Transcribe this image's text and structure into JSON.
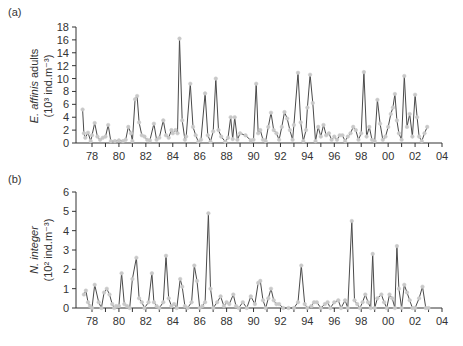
{
  "chart_data": [
    {
      "type": "line",
      "panel_label": "(a)",
      "title": "",
      "ylabel_species": "E. affinis",
      "ylabel_rest": " adults",
      "ylabel_unit": "(10³ ind.m⁻³)",
      "xlabel": "",
      "xlim": [
        1977,
        2004
      ],
      "ylim": [
        0,
        18
      ],
      "yticks": [
        0,
        2,
        4,
        6,
        8,
        10,
        12,
        14,
        16,
        18
      ],
      "xtick_labels": [
        "78",
        "80",
        "82",
        "84",
        "86",
        "88",
        "90",
        "92",
        "94",
        "96",
        "98",
        "00",
        "02",
        "04"
      ],
      "series": [
        {
          "name": "E. affinis adults",
          "x": [
            1977.3,
            1977.4,
            1977.5,
            1977.7,
            1977.9,
            1978.0,
            1978.2,
            1978.4,
            1978.6,
            1978.8,
            1979.0,
            1979.2,
            1979.4,
            1979.7,
            1980.0,
            1980.3,
            1980.5,
            1980.7,
            1980.9,
            1981.0,
            1981.2,
            1981.35,
            1981.5,
            1981.7,
            1981.9,
            1982.1,
            1982.3,
            1982.6,
            1982.8,
            1983.0,
            1983.3,
            1983.5,
            1983.7,
            1983.9,
            1984.0,
            1984.2,
            1984.35,
            1984.5,
            1984.7,
            1984.9,
            1985.0,
            1985.3,
            1985.5,
            1985.7,
            1985.9,
            1986.1,
            1986.4,
            1986.6,
            1986.8,
            1987.0,
            1987.2,
            1987.4,
            1987.6,
            1987.9,
            1988.1,
            1988.3,
            1988.45,
            1988.6,
            1988.8,
            1989.0,
            1989.4,
            1989.8,
            1990.0,
            1990.2,
            1990.35,
            1990.5,
            1990.7,
            1990.9,
            1991.1,
            1991.3,
            1991.5,
            1991.7,
            1991.9,
            1992.1,
            1992.3,
            1992.5,
            1992.7,
            1992.9,
            1993.0,
            1993.3,
            1993.5,
            1993.7,
            1993.9,
            1994.0,
            1994.2,
            1994.4,
            1994.6,
            1994.8,
            1995.0,
            1995.2,
            1995.4,
            1995.6,
            1995.8,
            1996.0,
            1996.2,
            1996.4,
            1996.6,
            1996.8,
            1997.0,
            1997.2,
            1997.4,
            1997.6,
            1997.8,
            1998.0,
            1998.2,
            1998.4,
            1998.6,
            1998.8,
            1999.0,
            1999.2,
            1999.4,
            1999.6,
            1999.8,
            2000.0,
            2000.2,
            2000.35,
            2000.5,
            2000.65,
            2000.8,
            2001.0,
            2001.2,
            2001.4,
            2001.6,
            2001.8,
            2002.0,
            2002.15,
            2002.3,
            2002.5,
            2002.7,
            2002.9
          ],
          "values": [
            5.2,
            1.5,
            0.8,
            1.6,
            0.3,
            1.2,
            3.1,
            1.0,
            0.5,
            0.8,
            1.0,
            2.8,
            0.3,
            0.3,
            0.4,
            0.3,
            0.5,
            2.5,
            1.5,
            0.3,
            6.8,
            7.3,
            3.2,
            1.2,
            1.0,
            0.5,
            0.4,
            3.0,
            0.5,
            0.8,
            3.5,
            1.2,
            0.8,
            2.0,
            1.5,
            2.0,
            1.5,
            16.2,
            3.5,
            0.5,
            1.0,
            9.2,
            2.5,
            1.2,
            0.2,
            0.5,
            7.7,
            1.2,
            0.2,
            1.8,
            10.0,
            2.0,
            1.0,
            0.2,
            0.8,
            4.0,
            0.6,
            4.0,
            0.5,
            1.5,
            1.2,
            0.4,
            0.5,
            9.2,
            1.5,
            2.0,
            0.5,
            0.3,
            2.5,
            4.7,
            2.0,
            1.5,
            0.5,
            2.5,
            4.8,
            3.8,
            2.0,
            0.5,
            2.8,
            10.9,
            3.2,
            0.3,
            2.0,
            5.5,
            10.6,
            6.2,
            0.3,
            2.5,
            1.0,
            2.8,
            1.2,
            1.5,
            0.5,
            1.0,
            0.5,
            1.2,
            1.2,
            0.3,
            1.0,
            1.5,
            2.5,
            2.0,
            0.5,
            1.5,
            11.0,
            1.0,
            2.5,
            0.5,
            0.3,
            6.7,
            3.0,
            0.5,
            1.0,
            2.5,
            4.5,
            5.5,
            7.6,
            3.5,
            1.5,
            0.5,
            10.4,
            2.5,
            4.5,
            1.0,
            7.5,
            4.0,
            1.0,
            0.3,
            1.5,
            2.5
          ]
        }
      ]
    },
    {
      "type": "line",
      "panel_label": "(b)",
      "title": "",
      "ylabel_species": "N. integer",
      "ylabel_rest": "",
      "ylabel_unit": "(10² ind.m⁻³)",
      "xlabel": "",
      "xlim": [
        1977,
        2004
      ],
      "ylim": [
        0,
        6
      ],
      "yticks": [
        0,
        1,
        2,
        3,
        4,
        5,
        6
      ],
      "xtick_labels": [
        "78",
        "80",
        "82",
        "84",
        "86",
        "88",
        "90",
        "92",
        "94",
        "96",
        "98",
        "00",
        "02",
        "04"
      ],
      "series": [
        {
          "name": "N. integer",
          "x": [
            1977.4,
            1977.55,
            1977.7,
            1977.85,
            1978.0,
            1978.2,
            1978.5,
            1978.7,
            1978.9,
            1979.1,
            1979.3,
            1979.5,
            1979.65,
            1979.8,
            1980.0,
            1980.2,
            1980.4,
            1980.6,
            1980.8,
            1981.0,
            1981.3,
            1981.5,
            1981.7,
            1981.9,
            1982.2,
            1982.45,
            1982.6,
            1982.8,
            1983.0,
            1983.3,
            1983.5,
            1983.7,
            1983.9,
            1984.1,
            1984.3,
            1984.55,
            1984.7,
            1984.9,
            1985.1,
            1985.4,
            1985.6,
            1985.8,
            1986.0,
            1986.2,
            1986.4,
            1986.65,
            1986.8,
            1987.0,
            1987.3,
            1987.55,
            1987.8,
            1988.0,
            1988.2,
            1988.5,
            1988.7,
            1988.9,
            1989.2,
            1989.5,
            1989.8,
            1990.1,
            1990.35,
            1990.5,
            1990.7,
            1990.9,
            1991.1,
            1991.3,
            1991.5,
            1991.7,
            1991.9,
            1992.2,
            1992.6,
            1993.0,
            1993.3,
            1993.55,
            1993.8,
            1994.0,
            1994.3,
            1994.5,
            1994.7,
            1995.0,
            1995.3,
            1995.5,
            1995.7,
            1996.0,
            1996.3,
            1996.5,
            1996.8,
            1997.0,
            1997.3,
            1997.5,
            1997.7,
            1997.9,
            1998.1,
            1998.3,
            1998.5,
            1998.7,
            1998.85,
            1999.0,
            1999.2,
            1999.5,
            1999.7,
            1999.9,
            2000.1,
            2000.3,
            2000.5,
            2000.65,
            2000.8,
            2001.0,
            2001.2,
            2001.4,
            2001.6,
            2001.8,
            2002.0,
            2002.3,
            2002.55,
            2002.8,
            2003.0
          ],
          "values": [
            0.7,
            0.9,
            0.3,
            0.1,
            0.0,
            1.2,
            0.3,
            0.0,
            0.8,
            1.0,
            0.7,
            0.2,
            0.0,
            0.1,
            0.1,
            1.8,
            0.2,
            0.1,
            0.0,
            1.5,
            2.6,
            0.5,
            0.3,
            0.0,
            0.3,
            1.8,
            0.3,
            0.1,
            0.0,
            0.3,
            2.7,
            0.5,
            0.1,
            0.2,
            0.0,
            1.5,
            1.1,
            0.1,
            0.0,
            0.3,
            2.2,
            1.4,
            0.0,
            0.1,
            0.3,
            4.9,
            1.0,
            0.0,
            0.3,
            0.6,
            0.1,
            0.3,
            0.2,
            0.7,
            0.1,
            0.0,
            0.3,
            0.0,
            0.6,
            0.2,
            1.3,
            1.4,
            0.4,
            0.0,
            0.5,
            1.0,
            0.4,
            0.2,
            0.2,
            0.0,
            0.0,
            0.0,
            0.3,
            2.2,
            0.2,
            0.0,
            0.1,
            0.3,
            0.3,
            0.0,
            0.2,
            0.3,
            0.0,
            0.3,
            0.4,
            0.0,
            0.4,
            0.0,
            4.5,
            0.4,
            0.2,
            0.0,
            0.3,
            0.7,
            0.3,
            0.0,
            2.8,
            0.0,
            0.5,
            0.7,
            0.3,
            0.0,
            0.7,
            0.5,
            0.0,
            3.2,
            1.0,
            0.0,
            1.2,
            0.8,
            0.4,
            0.0,
            0.0,
            0.5,
            1.1,
            0.0,
            0.0
          ]
        }
      ]
    }
  ],
  "panels": {
    "a": {
      "label": "(a)",
      "species": "E. affinis",
      "rest": " adults",
      "unit": "(10³ ind.m⁻³)"
    },
    "b": {
      "label": "(b)",
      "species": "N. integer",
      "rest": "",
      "unit": "(10² ind.m⁻³)"
    }
  },
  "colors": {
    "line": "#4a4a4a",
    "marker": "#c8c8c8",
    "axis": "#333333"
  }
}
